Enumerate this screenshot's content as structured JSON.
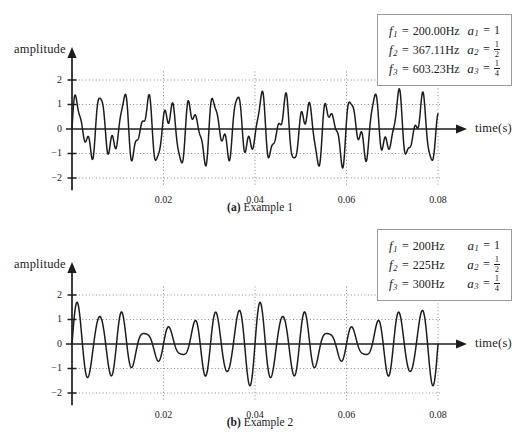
{
  "page": {
    "background": "#ffffff",
    "ink": "#1c1c1c",
    "grid_color": "#8a8a8a"
  },
  "figures": [
    {
      "id": "a",
      "caption_tag": "(a)",
      "caption_text": "Example 1",
      "axes": {
        "ylabel": "amplitude",
        "xlabel": "time(s)",
        "yticks": [
          "2",
          "1",
          "0",
          "−1",
          "−2"
        ],
        "ytick_values": [
          2,
          1,
          0,
          -1,
          -2
        ],
        "xticks": [
          "0.02",
          "0.04",
          "0.06",
          "0.08"
        ],
        "xtick_values": [
          0.02,
          0.04,
          0.06,
          0.08
        ],
        "xlim": [
          0,
          0.0855
        ],
        "ylim": [
          -2.45,
          2.45
        ],
        "grid": "dotted"
      },
      "legend": [
        {
          "sym": "f",
          "idx": "1",
          "value": "200.00Hz",
          "amp_sym": "a",
          "amp_idx": "1",
          "amp_value": "1",
          "amp_num": null,
          "amp_den": null
        },
        {
          "sym": "f",
          "idx": "2",
          "value": "367.11Hz",
          "amp_sym": "a",
          "amp_idx": "2",
          "amp_value": null,
          "amp_num": "1",
          "amp_den": "2"
        },
        {
          "sym": "f",
          "idx": "3",
          "value": "603.23Hz",
          "amp_sym": "a",
          "amp_idx": "3",
          "amp_value": null,
          "amp_num": "1",
          "amp_den": "4"
        }
      ],
      "chart_data": {
        "type": "line",
        "title": "Example 1",
        "xlabel": "time(s)",
        "ylabel": "amplitude",
        "xlim": [
          0,
          0.0855
        ],
        "ylim": [
          -2.45,
          2.45
        ],
        "xticks": [
          0.02,
          0.04,
          0.06,
          0.08
        ],
        "yticks": [
          -2,
          -1,
          0,
          1,
          2
        ],
        "grid": true,
        "legend_position": "top-right",
        "signal_model": "sum of sinusoids: y(t) = sum_k a_k * sin(2*pi*f_k*t)",
        "t_start": 0,
        "t_end": 0.08,
        "series": [
          {
            "name": "f1",
            "frequency_hz": 200.0,
            "amplitude": 1
          },
          {
            "name": "f2",
            "frequency_hz": 367.11,
            "amplitude": 0.5
          },
          {
            "name": "f3",
            "frequency_hz": 603.23,
            "amplitude": 0.25
          }
        ]
      }
    },
    {
      "id": "b",
      "caption_tag": "(b)",
      "caption_text": "Example 2",
      "axes": {
        "ylabel": "amplitude",
        "xlabel": "time(s)",
        "yticks": [
          "2",
          "1",
          "0",
          "−1",
          "−2"
        ],
        "ytick_values": [
          2,
          1,
          0,
          -1,
          -2
        ],
        "xticks": [
          "0.02",
          "0.04",
          "0.06",
          "0.08"
        ],
        "xtick_values": [
          0.02,
          0.04,
          0.06,
          0.08
        ],
        "xlim": [
          0,
          0.0855
        ],
        "ylim": [
          -2.45,
          2.45
        ],
        "grid": "dotted"
      },
      "legend": [
        {
          "sym": "f",
          "idx": "1",
          "value": "200Hz",
          "amp_sym": "a",
          "amp_idx": "1",
          "amp_value": "1",
          "amp_num": null,
          "amp_den": null
        },
        {
          "sym": "f",
          "idx": "2",
          "value": "225Hz",
          "amp_sym": "a",
          "amp_idx": "2",
          "amp_value": null,
          "amp_num": "1",
          "amp_den": "2"
        },
        {
          "sym": "f",
          "idx": "3",
          "value": "300Hz",
          "amp_sym": "a",
          "amp_idx": "3",
          "amp_value": null,
          "amp_num": "1",
          "amp_den": "4"
        }
      ],
      "chart_data": {
        "type": "line",
        "title": "Example 2",
        "xlabel": "time(s)",
        "ylabel": "amplitude",
        "xlim": [
          0,
          0.0855
        ],
        "ylim": [
          -2.45,
          2.45
        ],
        "xticks": [
          0.02,
          0.04,
          0.06,
          0.08
        ],
        "yticks": [
          -2,
          -1,
          0,
          1,
          2
        ],
        "grid": true,
        "legend_position": "top-right",
        "signal_model": "sum of sinusoids: y(t) = sum_k a_k * sin(2*pi*f_k*t)",
        "t_start": 0,
        "t_end": 0.08,
        "series": [
          {
            "name": "f1",
            "frequency_hz": 200,
            "amplitude": 1
          },
          {
            "name": "f2",
            "frequency_hz": 225,
            "amplitude": 0.5
          },
          {
            "name": "f3",
            "frequency_hz": 300,
            "amplitude": 0.25
          }
        ]
      }
    }
  ]
}
